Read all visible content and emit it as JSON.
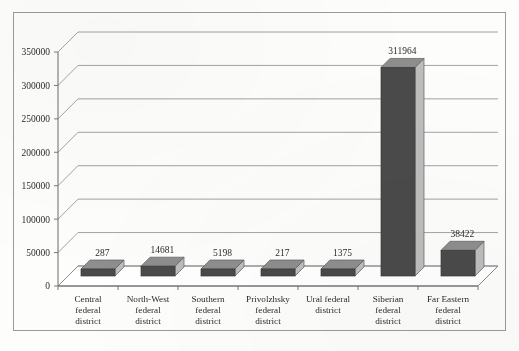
{
  "chart_data": {
    "type": "bar",
    "title": "",
    "subtitle": "",
    "xlabel": "",
    "ylabel": "",
    "ylim": [
      0,
      350000
    ],
    "ytick_step": 50000,
    "yticks": [
      "0",
      "50000",
      "100000",
      "150000",
      "200000",
      "250000",
      "300000",
      "350000"
    ],
    "grid": true,
    "legend": "none",
    "three_d": true,
    "categories": [
      "Central federal district",
      "North-West federal district",
      "Southern federal district",
      "Privolzhsky federal district",
      "Ural federal district",
      "Siberian federal district",
      "Far Eastern federal district"
    ],
    "category_lines": [
      [
        "Central",
        "federal",
        "district"
      ],
      [
        "North-West",
        "federal",
        "district"
      ],
      [
        "Southern",
        "federal",
        "district"
      ],
      [
        "Privolzhsky",
        "federal",
        "district"
      ],
      [
        "Ural federal",
        "district"
      ],
      [
        "Siberian",
        "federal",
        "district"
      ],
      [
        "Far Eastern",
        "federal",
        "district"
      ]
    ],
    "values": [
      287,
      14681,
      5198,
      217,
      1375,
      311964,
      38422
    ],
    "value_labels": [
      "287",
      "14681",
      "5198",
      "217",
      "1375",
      "311964",
      "38422"
    ],
    "colors": {
      "bar_front": "#4a4a4a",
      "bar_top": "#8e8e8e",
      "bar_side": "#bdbdbd",
      "grid_line": "#8c8c8c",
      "axis_line": "#6b6b6b",
      "frame": "#9a9a9a",
      "background": "#fdfdfb",
      "text": "#2b2b2b"
    }
  }
}
